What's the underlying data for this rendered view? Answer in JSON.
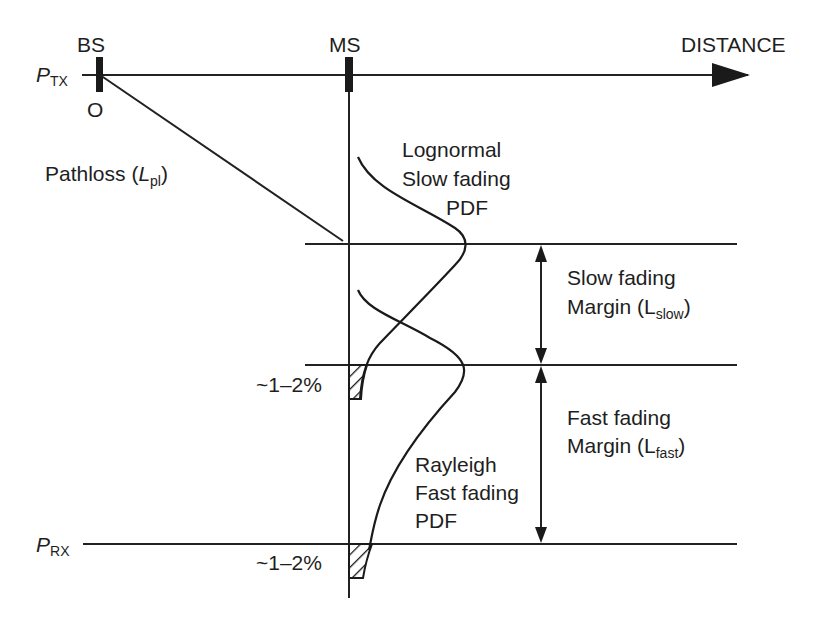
{
  "diagram": {
    "title_hint": "Link budget with slow and fast fading margins",
    "colors": {
      "ink": "#1e1e1e",
      "background": "#ffffff"
    },
    "labels": {
      "bs": "BS",
      "ms": "MS",
      "distance": "DISTANCE",
      "origin": "O",
      "ptx_main": "P",
      "ptx_sub": "TX",
      "prx_main": "P",
      "prx_sub": "RX",
      "pathloss_text": "Pathloss (",
      "pathloss_main": "L",
      "pathloss_sub": "pl",
      "pathloss_close": ")",
      "lognormal_line1": "Lognormal",
      "lognormal_line2": "Slow fading",
      "lognormal_line3": "PDF",
      "slow_margin_line1": "Slow fading",
      "slow_margin_line2_text": "Margin (L",
      "slow_margin_sub": "slow",
      "slow_margin_close": ")",
      "fast_margin_line1": "Fast fading",
      "fast_margin_line2_text": "Margin (L",
      "fast_margin_sub": "fast",
      "fast_margin_close": ")",
      "rayleigh_line1": "Rayleigh",
      "rayleigh_line2": "Fast fading",
      "rayleigh_line3": "PDF",
      "outage_upper": "~1–2%",
      "outage_lower": "~1–2%"
    }
  }
}
